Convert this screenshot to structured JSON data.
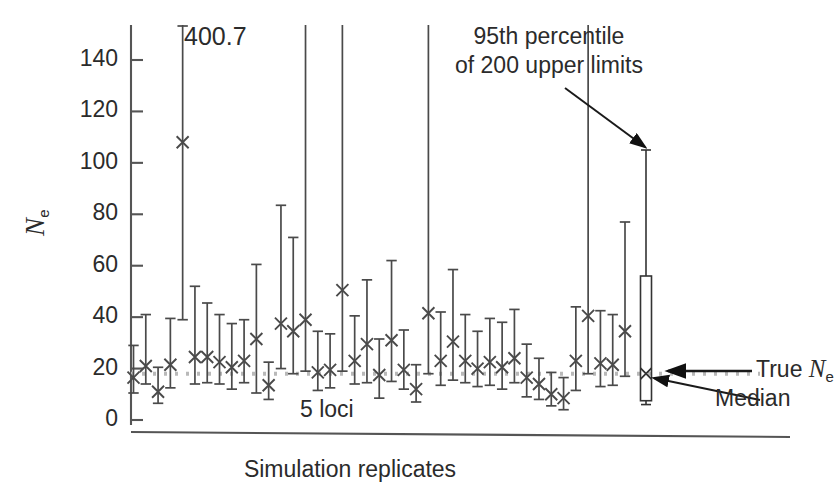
{
  "figure": {
    "axis": {
      "y_label_text": "N",
      "y_label_sub": "e",
      "x_label": "Simulation replicates",
      "y_ticks": [
        0,
        20,
        40,
        60,
        80,
        100,
        120,
        140
      ],
      "y_tick_labels": [
        "0",
        "20",
        "40",
        "60",
        "80",
        "100",
        "120",
        "140"
      ]
    },
    "annotations": {
      "peak_value": "400.7",
      "percentile_line1": "95th percentile",
      "percentile_line2": "of 200 upper limits",
      "true_ne_prefix": "True ",
      "true_ne_symbol": "N",
      "true_ne_sub": "e",
      "median_label": "Median",
      "loci_label": "5 loci"
    },
    "colors": {
      "ink": "#2b2b2b",
      "axis": "#555555",
      "errorbar": "#4a4a4a",
      "true_line": "#b9b9b9",
      "box_stroke": "#333333"
    }
  },
  "chart_data": {
    "type": "scatter",
    "title": "",
    "xlabel": "Simulation replicates",
    "ylabel": "Ne",
    "ylim": [
      0,
      155
    ],
    "grid": false,
    "legend": "none",
    "true_ne_value": 18,
    "series": [
      {
        "name": "point estimates with confidence limits",
        "marker": "x",
        "points": [
          {
            "index": 1,
            "estimate": 16.5,
            "lower": 10.5,
            "upper": 29.0
          },
          {
            "index": 2,
            "estimate": 21.0,
            "lower": 14.0,
            "upper": 41.0
          },
          {
            "index": 3,
            "estimate": 11.0,
            "lower": 6.5,
            "upper": 20.5
          },
          {
            "index": 4,
            "estimate": 21.5,
            "lower": 12.5,
            "upper": 39.5
          },
          {
            "index": 5,
            "estimate": 108.0,
            "lower": 39.0,
            "upper": 400.7,
            "label": "400.7",
            "clipped": true
          },
          {
            "index": 6,
            "estimate": 24.5,
            "lower": 14.0,
            "upper": 52.0
          },
          {
            "index": 7,
            "estimate": 24.5,
            "lower": 14.5,
            "upper": 45.5
          },
          {
            "index": 8,
            "estimate": 22.5,
            "lower": 14.0,
            "upper": 41.0
          },
          {
            "index": 9,
            "estimate": 20.5,
            "lower": 12.0,
            "upper": 37.5
          },
          {
            "index": 10,
            "estimate": 23.0,
            "lower": 14.5,
            "upper": 39.0
          },
          {
            "index": 11,
            "estimate": 31.5,
            "lower": 10.5,
            "upper": 60.5
          },
          {
            "index": 12,
            "estimate": 13.5,
            "lower": 8.0,
            "upper": 22.5
          },
          {
            "index": 13,
            "estimate": 37.5,
            "lower": 20.0,
            "upper": 83.5
          },
          {
            "index": 14,
            "estimate": 34.5,
            "lower": 18.0,
            "upper": 71.0
          },
          {
            "index": 15,
            "estimate": 39.0,
            "lower": 19.0,
            "upper": 155.0,
            "clipped": true
          },
          {
            "index": 16,
            "estimate": 18.5,
            "lower": 11.5,
            "upper": 34.5
          },
          {
            "index": 17,
            "estimate": 19.5,
            "lower": 12.5,
            "upper": 33.5
          },
          {
            "index": 18,
            "estimate": 50.5,
            "lower": 19.0,
            "upper": 155.0,
            "clipped": true
          },
          {
            "index": 19,
            "estimate": 23.0,
            "lower": 14.0,
            "upper": 40.5
          },
          {
            "index": 20,
            "estimate": 29.5,
            "lower": 14.5,
            "upper": 54.5
          },
          {
            "index": 21,
            "estimate": 17.5,
            "lower": 8.5,
            "upper": 31.5
          },
          {
            "index": 22,
            "estimate": 31.0,
            "lower": 15.0,
            "upper": 62.0
          },
          {
            "index": 23,
            "estimate": 19.5,
            "lower": 12.0,
            "upper": 35.0
          },
          {
            "index": 24,
            "estimate": 12.0,
            "lower": 7.0,
            "upper": 21.5
          },
          {
            "index": 25,
            "estimate": 41.5,
            "lower": 18.0,
            "upper": 155.0,
            "clipped": true
          },
          {
            "index": 26,
            "estimate": 23.0,
            "lower": 13.5,
            "upper": 42.0
          },
          {
            "index": 27,
            "estimate": 30.5,
            "lower": 15.5,
            "upper": 58.5
          },
          {
            "index": 28,
            "estimate": 23.0,
            "lower": 14.5,
            "upper": 41.0
          },
          {
            "index": 29,
            "estimate": 20.0,
            "lower": 13.0,
            "upper": 34.5
          },
          {
            "index": 30,
            "estimate": 22.5,
            "lower": 13.5,
            "upper": 39.5
          },
          {
            "index": 31,
            "estimate": 20.5,
            "lower": 12.0,
            "upper": 38.0
          },
          {
            "index": 32,
            "estimate": 24.0,
            "lower": 14.5,
            "upper": 43.0
          },
          {
            "index": 33,
            "estimate": 16.5,
            "lower": 9.0,
            "upper": 29.5
          },
          {
            "index": 34,
            "estimate": 14.0,
            "lower": 8.0,
            "upper": 24.0
          },
          {
            "index": 35,
            "estimate": 10.0,
            "lower": 5.5,
            "upper": 18.5
          },
          {
            "index": 36,
            "estimate": 8.5,
            "lower": 4.0,
            "upper": 16.5
          },
          {
            "index": 37,
            "estimate": 23.0,
            "lower": 11.5,
            "upper": 44.0
          },
          {
            "index": 38,
            "estimate": 40.5,
            "lower": 18.0,
            "upper": 155.0,
            "clipped": true
          },
          {
            "index": 39,
            "estimate": 22.0,
            "lower": 13.0,
            "upper": 42.5
          },
          {
            "index": 40,
            "estimate": 21.5,
            "lower": 13.5,
            "upper": 41.0
          },
          {
            "index": 41,
            "estimate": 34.5,
            "lower": 17.0,
            "upper": 77.0
          }
        ]
      }
    ],
    "summary_box": {
      "name": "distribution of 200 replicates",
      "whisker_high": 105.0,
      "box_top": 56.0,
      "median": 18.0,
      "box_bottom": 7.5,
      "whisker_low": 6.0
    }
  }
}
